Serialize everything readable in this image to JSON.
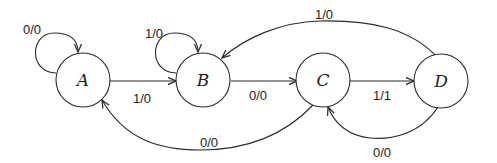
{
  "diagram": {
    "type": "finite-state-machine",
    "states": [
      {
        "id": "A",
        "label": "A"
      },
      {
        "id": "B",
        "label": "B"
      },
      {
        "id": "C",
        "label": "C"
      },
      {
        "id": "D",
        "label": "D"
      }
    ],
    "transitions": [
      {
        "from": "A",
        "to": "A",
        "label": "0/0"
      },
      {
        "from": "A",
        "to": "B",
        "label": "1/0"
      },
      {
        "from": "B",
        "to": "B",
        "label": "1/0"
      },
      {
        "from": "B",
        "to": "C",
        "label": "0/0"
      },
      {
        "from": "C",
        "to": "D",
        "label": "1/1"
      },
      {
        "from": "C",
        "to": "A",
        "label": "0/0"
      },
      {
        "from": "D",
        "to": "B",
        "label": "1/0"
      },
      {
        "from": "D",
        "to": "C",
        "label": "0/0"
      }
    ]
  }
}
